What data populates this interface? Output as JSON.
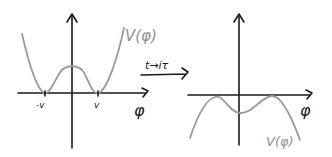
{
  "diagram": {
    "title": "",
    "left_panel": {
      "curve_label": "V(φ)",
      "x_axis_label": "φ",
      "tick_labels": [
        "-v",
        "v"
      ],
      "description": "Double-well potential with minima at -v and v and a local maximum at φ=0",
      "curve_color": "#9a9a9a",
      "axis_color": "#1a1a1a"
    },
    "transform": {
      "label": "t→iτ",
      "arrow_direction": "right"
    },
    "right_panel": {
      "curve_label": "V(φ)",
      "x_axis_label": "φ",
      "description": "Inverted potential (−V) after Wick rotation: maxima near ±v, local minimum at φ=0",
      "curve_color": "#9a9a9a",
      "axis_color": "#1a1a1a"
    }
  }
}
